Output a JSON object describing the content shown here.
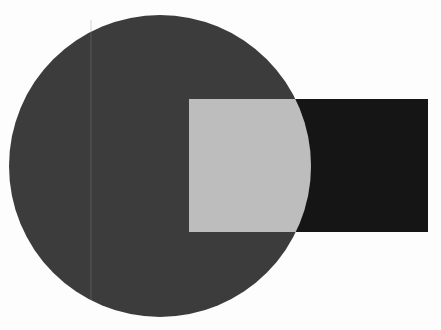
{
  "canvas": {
    "width": 441,
    "height": 330,
    "background": "#fdfdfd"
  },
  "shapes": {
    "circle": {
      "cx": 160,
      "cy": 166,
      "r": 151,
      "fill": "#3c3c3c"
    },
    "rectangle": {
      "x": 189,
      "y": 99,
      "width": 239,
      "height": 133,
      "fill": "#151515"
    },
    "intersection": {
      "fill": "#bdbdbd"
    },
    "guide_line": {
      "x": 91,
      "color": "#8a8a8a"
    }
  }
}
